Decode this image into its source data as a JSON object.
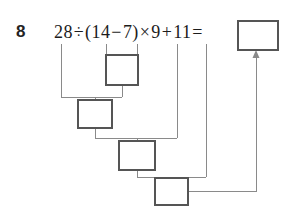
{
  "problem": {
    "number": "8",
    "expression_tokens": [
      {
        "text": "28",
        "kind": "number"
      },
      {
        "text": "÷",
        "kind": "operator"
      },
      {
        "text": "(",
        "kind": "paren"
      },
      {
        "text": "14",
        "kind": "number"
      },
      {
        "text": "−",
        "kind": "operator"
      },
      {
        "text": "7",
        "kind": "number"
      },
      {
        "text": ")",
        "kind": "paren"
      },
      {
        "text": "×",
        "kind": "operator"
      },
      {
        "text": "9",
        "kind": "number"
      },
      {
        "text": "+",
        "kind": "operator"
      },
      {
        "text": "11",
        "kind": "number"
      },
      {
        "text": "=",
        "kind": "operator"
      }
    ],
    "expression_plain": "28÷(14−7)×9+11="
  },
  "answer_box": {
    "value": "",
    "placeholder": ""
  },
  "step_boxes": [
    {
      "id": "step-1",
      "value": "",
      "placeholder": "",
      "source": "14−7"
    },
    {
      "id": "step-2",
      "value": "",
      "placeholder": "",
      "source": "28÷step-1"
    },
    {
      "id": "step-3",
      "value": "",
      "placeholder": "",
      "source": "step-2×9"
    },
    {
      "id": "step-4",
      "value": "",
      "placeholder": "",
      "source": "step-3+11"
    }
  ],
  "colors": {
    "ink": "#1c1c1c",
    "box_stroke": "#555555",
    "connector": "#8a8a8a",
    "background": "#ffffff"
  },
  "icons": {
    "arrow_up": "arrow-up-icon"
  }
}
